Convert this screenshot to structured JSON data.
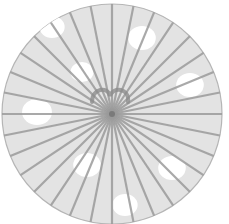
{
  "illustration": {
    "subject": "parasol-top-view",
    "canvas": {
      "width": 229,
      "height": 224
    },
    "canopy": {
      "cx": 112,
      "cy": 114,
      "r": 110,
      "fill": "#e3e3e3",
      "stroke": "#b5b5b5"
    },
    "spokes": {
      "count": 32,
      "color": "#9a9a9a",
      "width": 2.2,
      "start_angle_deg": 0
    },
    "dots": [
      {
        "cx": 52,
        "cy": 27,
        "r": 11
      },
      {
        "cx": 142,
        "cy": 38,
        "r": 12
      },
      {
        "cx": 190,
        "cy": 85,
        "r": 12
      },
      {
        "cx": 82,
        "cy": 72,
        "r": 10
      },
      {
        "cx": 37,
        "cy": 112,
        "r": 13
      },
      {
        "cx": 87,
        "cy": 165,
        "r": 12
      },
      {
        "cx": 172,
        "cy": 168,
        "r": 12
      },
      {
        "cx": 125,
        "cy": 205,
        "r": 11
      }
    ],
    "dot_color": "#ffffff",
    "handle": {
      "path": "M92 102 C 92 88, 108 86, 110 96 C 113 86, 130 88, 128 102",
      "color": "#8c8c8c",
      "width": 4
    }
  }
}
